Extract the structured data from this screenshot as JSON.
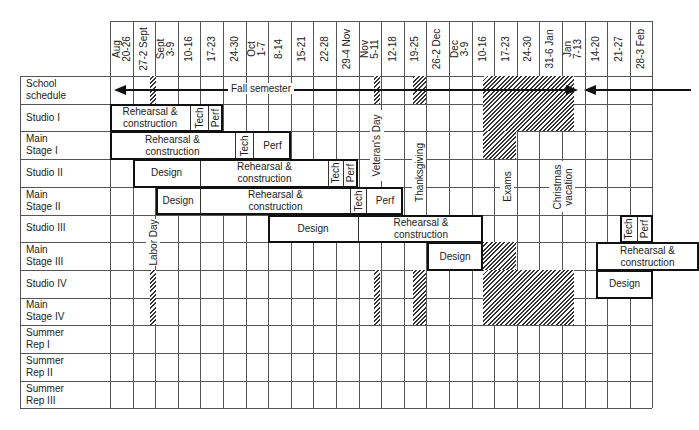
{
  "chart_data": {
    "type": "gantt",
    "title": "",
    "columns": [
      "Aug\n20-26",
      "27-2 Sept",
      "Sept\n3-9",
      "10-16",
      "17-23",
      "24-30",
      "Oct\n1-7",
      "8-14",
      "15-21",
      "22-28",
      "29-4 Nov",
      "Nov\n5-11",
      "12-18",
      "19-25",
      "26-2 Dec",
      "Dec\n3-9",
      "10-16",
      "17-23",
      "24-30",
      "31-6 Jan",
      "Jan\n7-13",
      "14-20",
      "21-27",
      "28-3 Feb"
    ],
    "rows": [
      "School\nschedule",
      "Studio I",
      "Main\nStage I",
      "Studio II",
      "Main\nStage II",
      "Studio III",
      "Main\nStage III",
      "Studio IV",
      "Main\nStage IV",
      "Summer\nRep I",
      "Summer\nRep II",
      "Summer\nRep III"
    ],
    "semester_label": "Fall semester",
    "holidays": [
      "Labor Day",
      "Veteran's Day",
      "Thanksgiving",
      "Exams",
      "Christmas\nvacation"
    ],
    "blocks": [
      {
        "row": "Studio I",
        "segments": [
          {
            "label": "Rehearsal &\nconstruction",
            "x0": 110,
            "x1": 190
          },
          {
            "label": "Tech",
            "x0": 190,
            "x1": 208,
            "vertical": true
          },
          {
            "label": "Perf",
            "x0": 208,
            "x1": 223,
            "vertical": true
          }
        ]
      },
      {
        "row": "Main Stage I",
        "segments": [
          {
            "label": "Rehearsal &\nconstruction",
            "x0": 110,
            "x1": 235
          },
          {
            "label": "Tech",
            "x0": 235,
            "x1": 253,
            "vertical": true
          },
          {
            "label": "Perf",
            "x0": 253,
            "x1": 291
          }
        ]
      },
      {
        "row": "Studio II",
        "segments": [
          {
            "label": "Design",
            "x0": 133,
            "x1": 200
          },
          {
            "label": "Rehearsal &\nconstruction",
            "x0": 200,
            "x1": 328
          },
          {
            "label": "Tech",
            "x0": 328,
            "x1": 343,
            "vertical": true
          },
          {
            "label": "Perf",
            "x0": 343,
            "x1": 358,
            "vertical": true
          }
        ]
      },
      {
        "row": "Main Stage II",
        "segments": [
          {
            "label": "Design",
            "x0": 156,
            "x1": 200
          },
          {
            "label": "Rehearsal &\nconstruction",
            "x0": 200,
            "x1": 350
          },
          {
            "label": "Tech",
            "x0": 350,
            "x1": 366,
            "vertical": true
          },
          {
            "label": "Perf",
            "x0": 366,
            "x1": 403
          }
        ]
      },
      {
        "row": "Studio III",
        "segments": [
          {
            "label": "Design",
            "x0": 268,
            "x1": 358
          },
          {
            "label": "Rehearsal &\nconstruction",
            "x0": 358,
            "x1": 483
          }
        ]
      },
      {
        "row": "Studio III",
        "segments": [
          {
            "label": "Tech",
            "x0": 620,
            "x1": 637,
            "vertical": true
          },
          {
            "label": "Perf",
            "x0": 637,
            "x1": 653,
            "vertical": true
          }
        ]
      },
      {
        "row": "Main Stage III",
        "segments": [
          {
            "label": "Design",
            "x0": 427,
            "x1": 483
          }
        ]
      },
      {
        "row": "Main Stage III",
        "segments": [
          {
            "label": "Rehearsal &\nconstruction",
            "x0": 596,
            "x1": 699
          }
        ]
      },
      {
        "row": "Studio IV",
        "segments": [
          {
            "label": "Design",
            "x0": 596,
            "x1": 653
          }
        ]
      }
    ]
  }
}
